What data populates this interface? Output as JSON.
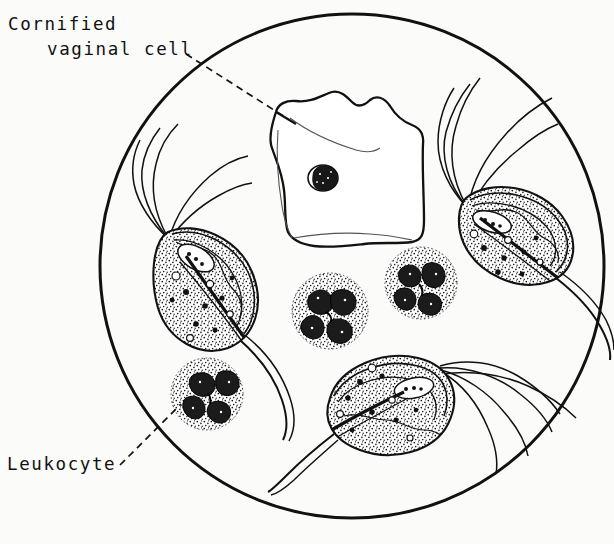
{
  "figure": {
    "kind": "microscopy-illustration",
    "background_color": "#fbfbfa",
    "ink_color": "#111111",
    "field": {
      "shape": "circle",
      "center_x": 352,
      "center_y": 266,
      "radius": 252,
      "stroke_width": 3.0
    }
  },
  "labels": [
    {
      "id": "cornified-vaginal-cell",
      "line1": "Cornified",
      "line2": "vaginal cell",
      "leader": {
        "style": "dashed",
        "from_x": 186,
        "from_y": 54,
        "to_x": 288,
        "to_y": 119
      }
    },
    {
      "id": "leukocyte",
      "line1": "Leukocyte",
      "line2": "",
      "leader": {
        "style": "dashed",
        "from_x": 120,
        "from_y": 465,
        "to_x": 181,
        "to_y": 404
      }
    }
  ],
  "specimens": {
    "cornified_cell": {
      "name": "cornified vaginal epithelial cell",
      "count": 1,
      "center_x": 322,
      "center_y": 168,
      "nucleus_x": 323,
      "nucleus_y": 178
    },
    "leukocytes": {
      "name": "polymorphonuclear leukocyte",
      "count": 3,
      "items": [
        {
          "id": "leukocyte-center",
          "cx": 330,
          "cy": 311,
          "r": 38
        },
        {
          "id": "leukocyte-upper-right",
          "cx": 421,
          "cy": 283,
          "r": 36
        },
        {
          "id": "leukocyte-lower-left",
          "cx": 207,
          "cy": 394,
          "r": 36
        }
      ]
    },
    "trichomonads": {
      "name": "Trichomonas vaginalis",
      "count": 3,
      "items": [
        {
          "id": "trichomonad-left",
          "cx": 208,
          "cy": 287,
          "angle": -56,
          "length": 110,
          "width": 62
        },
        {
          "id": "trichomonad-right",
          "cx": 513,
          "cy": 219,
          "angle": 28,
          "length": 108,
          "width": 58
        },
        {
          "id": "trichomonad-bottom",
          "cx": 383,
          "cy": 406,
          "angle": -8,
          "length": 112,
          "width": 62
        }
      ]
    }
  }
}
